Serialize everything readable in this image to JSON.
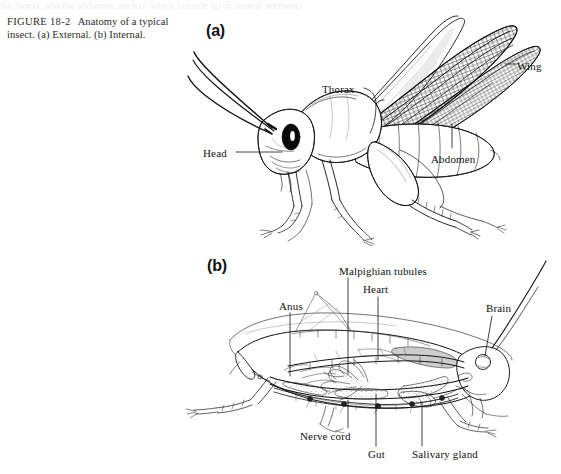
{
  "page": {
    "background_color": "#ffffff",
    "width": 561,
    "height": 474,
    "ink_color": "#111111"
  },
  "top_remnant_text": "the thorax, and the abdomen, each of which is made up of several segments",
  "caption": {
    "figure_label": "FIGURE 18-2",
    "text": "Anatomy of a typical insect. (a) External. (b) Internal."
  },
  "panels": [
    {
      "id": "a",
      "letter": "(a)",
      "subject": "grasshopper-external-anatomy",
      "labels": [
        {
          "id": "thorax",
          "text": "Thorax",
          "leader": "curly-brace-right"
        },
        {
          "id": "wing",
          "text": "Wing",
          "leader": "short-dash-left"
        },
        {
          "id": "head",
          "text": "Head",
          "leader": "horizontal-line-right"
        },
        {
          "id": "abdomen",
          "text": "Abdomen",
          "leader": "vertical-line-up"
        }
      ]
    },
    {
      "id": "b",
      "letter": "(b)",
      "subject": "grasshopper-internal-anatomy",
      "labels": [
        {
          "id": "malpighian",
          "text": "Malpighian tubules",
          "leader": "vertical-line-down"
        },
        {
          "id": "heart",
          "text": "Heart",
          "leader": "vertical-line-down"
        },
        {
          "id": "anus",
          "text": "Anus",
          "leader": "vertical-line-down"
        },
        {
          "id": "brain",
          "text": "Brain",
          "leader": "vertical-line-down"
        },
        {
          "id": "nervecord",
          "text": "Nerve cord",
          "leader": "vertical-line-up"
        },
        {
          "id": "gut",
          "text": "Gut",
          "leader": "vertical-line-up"
        },
        {
          "id": "salivary",
          "text": "Salivary gland",
          "leader": "vertical-line-up"
        }
      ]
    }
  ]
}
